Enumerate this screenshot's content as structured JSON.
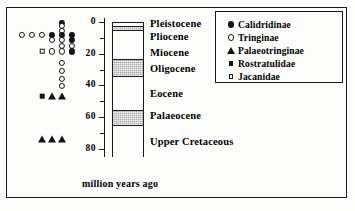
{
  "chart_data": {
    "type": "scatter",
    "title": "",
    "xlabel": "million years ago",
    "ylabel": "",
    "axis_orientation": "vertical-inverted",
    "ylim": [
      0,
      85
    ],
    "tick_labels": [
      "0",
      "20",
      "40",
      "60",
      "80"
    ],
    "tick_values": [
      0,
      20,
      40,
      60,
      80
    ],
    "minor_tick_values": [
      10,
      30,
      50,
      70
    ],
    "grid": false,
    "legend_position": "top-right",
    "legend": [
      {
        "label": "Calidridinae",
        "marker": "filled-circle"
      },
      {
        "label": "Tringinae",
        "marker": "open-circle"
      },
      {
        "label": "Palaeotringinae",
        "marker": "filled-triangle"
      },
      {
        "label": "Rostratulidae",
        "marker": "filled-square"
      },
      {
        "label": "Jacanidae",
        "marker": "open-square"
      }
    ],
    "epochs": [
      {
        "name": "Pleistocene",
        "top_ma": 0,
        "bottom_ma": 1.8,
        "shaded": false
      },
      {
        "name": "Pliocene",
        "top_ma": 1.8,
        "bottom_ma": 5.3,
        "shaded": true
      },
      {
        "name": "Miocene",
        "top_ma": 5.3,
        "bottom_ma": 23.0,
        "shaded": false
      },
      {
        "name": "Oligocene",
        "top_ma": 23.0,
        "bottom_ma": 34.0,
        "shaded": true
      },
      {
        "name": "Eocene",
        "top_ma": 34.0,
        "bottom_ma": 55.0,
        "shaded": false
      },
      {
        "name": "Palaeocene",
        "top_ma": 55.0,
        "bottom_ma": 65.0,
        "shaded": true
      },
      {
        "name": "Upper Cretaceous",
        "top_ma": 65.0,
        "bottom_ma": 85.0,
        "shaded": false
      }
    ],
    "points": [
      {
        "marker": "filled-circle",
        "taxon": "Calidridinae",
        "age_ma": 0.5,
        "slot": 5
      },
      {
        "marker": "open-circle",
        "taxon": "Tringinae",
        "age_ma": 2.5,
        "slot": 5
      },
      {
        "marker": "open-circle",
        "taxon": "Tringinae",
        "age_ma": 5.5,
        "slot": 5
      },
      {
        "marker": "open-circle",
        "taxon": "Tringinae",
        "age_ma": 8.0,
        "slot": 1
      },
      {
        "marker": "open-circle",
        "taxon": "Tringinae",
        "age_ma": 8.0,
        "slot": 2
      },
      {
        "marker": "open-circle",
        "taxon": "Tringinae",
        "age_ma": 8.0,
        "slot": 3
      },
      {
        "marker": "filled-circle",
        "taxon": "Calidridinae",
        "age_ma": 8.0,
        "slot": 4
      },
      {
        "marker": "filled-circle",
        "taxon": "Calidridinae",
        "age_ma": 8.0,
        "slot": 5
      },
      {
        "marker": "filled-circle",
        "taxon": "Calidridinae",
        "age_ma": 8.0,
        "slot": 6
      },
      {
        "marker": "open-circle",
        "taxon": "Tringinae",
        "age_ma": 11.5,
        "slot": 4
      },
      {
        "marker": "open-circle",
        "taxon": "Tringinae",
        "age_ma": 11.5,
        "slot": 5
      },
      {
        "marker": "filled-circle",
        "taxon": "Calidridinae",
        "age_ma": 11.5,
        "slot": 6
      },
      {
        "marker": "open-circle",
        "taxon": "Tringinae",
        "age_ma": 15.0,
        "slot": 5
      },
      {
        "marker": "open-circle",
        "taxon": "Tringinae",
        "age_ma": 15.0,
        "slot": 6
      },
      {
        "marker": "open-square",
        "taxon": "Jacanidae",
        "age_ma": 18.5,
        "slot": 3
      },
      {
        "marker": "open-circle",
        "taxon": "Tringinae",
        "age_ma": 18.5,
        "slot": 4
      },
      {
        "marker": "open-circle",
        "taxon": "Tringinae",
        "age_ma": 18.5,
        "slot": 5
      },
      {
        "marker": "filled-circle",
        "taxon": "Calidridinae",
        "age_ma": 18.5,
        "slot": 6
      },
      {
        "marker": "open-circle",
        "taxon": "Tringinae",
        "age_ma": 26.0,
        "slot": 5
      },
      {
        "marker": "open-circle",
        "taxon": "Tringinae",
        "age_ma": 31.0,
        "slot": 5
      },
      {
        "marker": "open-circle",
        "taxon": "Tringinae",
        "age_ma": 36.0,
        "slot": 5
      },
      {
        "marker": "open-circle",
        "taxon": "Tringinae",
        "age_ma": 40.5,
        "slot": 5
      },
      {
        "marker": "filled-square",
        "taxon": "Rostratulidae",
        "age_ma": 47.0,
        "slot": 3
      },
      {
        "marker": "filled-triangle",
        "taxon": "Palaeotringinae",
        "age_ma": 47.0,
        "slot": 4
      },
      {
        "marker": "filled-triangle",
        "taxon": "Palaeotringinae",
        "age_ma": 47.0,
        "slot": 5
      },
      {
        "marker": "filled-triangle",
        "taxon": "Palaeotringinae",
        "age_ma": 74.0,
        "slot": 3
      },
      {
        "marker": "filled-triangle",
        "taxon": "Palaeotringinae",
        "age_ma": 74.0,
        "slot": 4
      },
      {
        "marker": "filled-triangle",
        "taxon": "Palaeotringinae",
        "age_ma": 74.0,
        "slot": 5
      }
    ]
  }
}
